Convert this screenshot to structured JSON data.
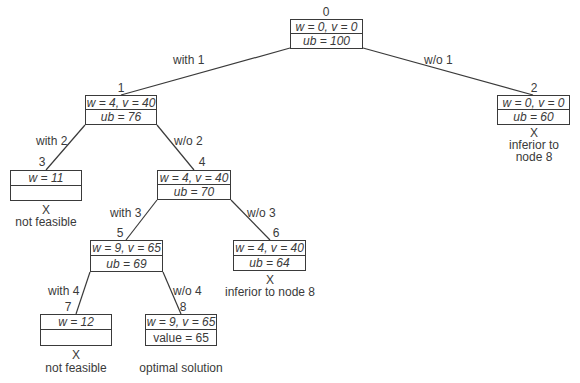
{
  "diagram": {
    "nodes": [
      {
        "id": "0",
        "label": "0",
        "top": "w = 0, v = 0",
        "bottom": "ub = 100",
        "note": ""
      },
      {
        "id": "1",
        "label": "1",
        "top": "w = 4, v = 40",
        "bottom": "ub = 76",
        "note": ""
      },
      {
        "id": "2",
        "label": "2",
        "top": "w = 0, v = 0",
        "bottom": "ub = 60",
        "mark": "X",
        "note": "inferior to",
        "note2": "node 8"
      },
      {
        "id": "3",
        "label": "3",
        "top": "w = 11",
        "bottom": "",
        "mark": "X",
        "note": "not feasible"
      },
      {
        "id": "4",
        "label": "4",
        "top": "w = 4, v = 40",
        "bottom": "ub = 70",
        "note": ""
      },
      {
        "id": "5",
        "label": "5",
        "top": "w = 9, v = 65",
        "bottom": "ub = 69",
        "note": ""
      },
      {
        "id": "6",
        "label": "6",
        "top": "w = 4, v = 40",
        "bottom": "ub = 64",
        "mark": "X",
        "note": "inferior to node 8"
      },
      {
        "id": "7",
        "label": "7",
        "top": "w = 12",
        "bottom": "",
        "mark": "X",
        "note": "not feasible"
      },
      {
        "id": "8",
        "label": "8",
        "top": "w = 9, v = 65",
        "bottom": "value = 65",
        "note": "optimal solution"
      }
    ],
    "edges": [
      {
        "from": "0",
        "to": "1",
        "label": "with 1"
      },
      {
        "from": "0",
        "to": "2",
        "label": "w/o 1"
      },
      {
        "from": "1",
        "to": "3",
        "label": "with 2"
      },
      {
        "from": "1",
        "to": "4",
        "label": "w/o 2"
      },
      {
        "from": "4",
        "to": "5",
        "label": "with 3"
      },
      {
        "from": "4",
        "to": "6",
        "label": "w/o 3"
      },
      {
        "from": "5",
        "to": "7",
        "label": "with 4"
      },
      {
        "from": "5",
        "to": "8",
        "label": "w/o 4"
      }
    ]
  }
}
